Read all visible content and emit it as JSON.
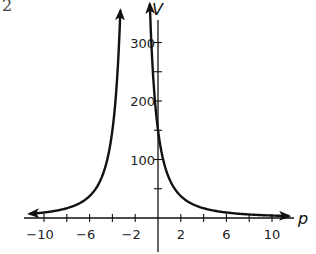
{
  "corner_fragment": "2",
  "chart_data": {
    "type": "line",
    "title": "",
    "xlabel": "p",
    "ylabel": "V",
    "xlim": [
      -11.5,
      12
    ],
    "ylim": [
      0,
      340
    ],
    "grid": false,
    "legend": null,
    "x_ticks": [
      -10,
      -8,
      -6,
      -4,
      -2,
      0,
      2,
      4,
      6,
      8,
      10
    ],
    "x_tick_labels": [
      "−10",
      "−6",
      "−2",
      "2",
      "6",
      "10"
    ],
    "x_tick_label_values": [
      -10,
      -6,
      -2,
      2,
      6,
      10
    ],
    "y_ticks": [
      50,
      100,
      150,
      200,
      250,
      300
    ],
    "y_tick_labels": [
      "100",
      "200",
      "300"
    ],
    "y_tick_label_values": [
      100,
      200,
      300
    ],
    "vertical_asymptote": -2,
    "function_estimate": "V = 600/(p+2)^2",
    "series": [
      {
        "name": "left branch",
        "x": [
          -11.3,
          -10,
          -8,
          -6,
          -5,
          -4,
          -3.6,
          -3.3
        ],
        "y": [
          7,
          9,
          17,
          38,
          67,
          150,
          234,
          345
        ],
        "arrows": "both ends"
      },
      {
        "name": "right branch",
        "x": [
          -0.7,
          -0.5,
          0,
          1,
          2,
          4,
          6,
          8,
          10,
          11.5
        ],
        "y": [
          345,
          267,
          150,
          67,
          38,
          17,
          9,
          6,
          4,
          3
        ],
        "arrows": "both ends"
      }
    ]
  }
}
